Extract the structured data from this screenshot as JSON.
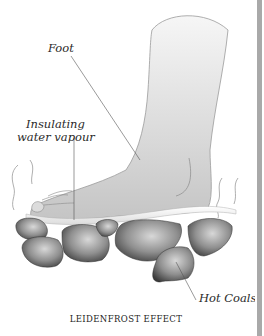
{
  "diagram": {
    "caption": "LEIDENFROST EFFECT",
    "labels": {
      "foot": "Foot",
      "insulating_line1": "Insulating",
      "insulating_line2": "water vapour",
      "hot_coals": "Hot Coals"
    },
    "colors": {
      "background": "#ffffff",
      "foot_fill_light": "#f4f4f4",
      "foot_fill_dark": "#c9c9c9",
      "foot_outline": "#9a9a9a",
      "vapour_layer": "#e6e6e6",
      "coal_light": "#cfcfcf",
      "coal_dark": "#3a3a3a",
      "leader_line": "#555555",
      "right_border": "#a9a9a9"
    }
  }
}
